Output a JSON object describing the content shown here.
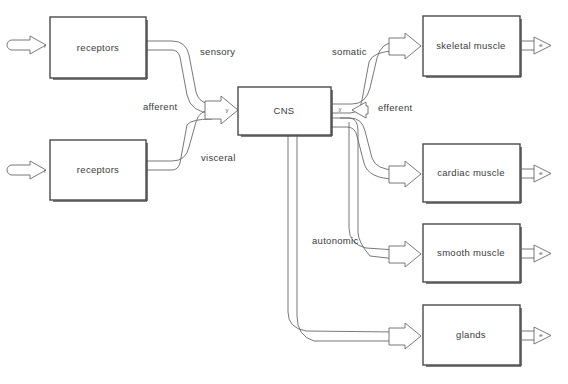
{
  "diagram": {
    "colors": {
      "background": "#ffffff",
      "stroke": "#4a4a4a",
      "pipe": "#6a6a6a",
      "text": "#3a3a3a"
    },
    "boxes": [
      {
        "id": "receptors-top",
        "label": "receptors",
        "x": 50,
        "y": 17,
        "w": 96,
        "h": 61
      },
      {
        "id": "receptors-bottom",
        "label": "receptors",
        "x": 50,
        "y": 140,
        "w": 96,
        "h": 60
      },
      {
        "id": "cns",
        "label": "CNS",
        "x": 238,
        "y": 87,
        "w": 93,
        "h": 48
      },
      {
        "id": "skeletal-muscle",
        "label": "skeletal muscle",
        "x": 423,
        "y": 16,
        "w": 97,
        "h": 60
      },
      {
        "id": "cardiac-muscle",
        "label": "cardiac muscle",
        "x": 423,
        "y": 144,
        "w": 97,
        "h": 58
      },
      {
        "id": "smooth-muscle",
        "label": "smooth muscle",
        "x": 423,
        "y": 224,
        "w": 97,
        "h": 58
      },
      {
        "id": "glands",
        "label": "glands",
        "x": 423,
        "y": 305,
        "w": 97,
        "h": 60
      }
    ],
    "edge_labels": [
      {
        "id": "sensory",
        "text": "sensory",
        "x": 200,
        "y": 52
      },
      {
        "id": "afferent",
        "text": "afferent",
        "x": 143,
        "y": 107
      },
      {
        "id": "visceral",
        "text": "visceral",
        "x": 201,
        "y": 158
      },
      {
        "id": "somatic",
        "text": "somatic",
        "x": 332,
        "y": 52
      },
      {
        "id": "efferent",
        "text": "efferent",
        "x": 378,
        "y": 108
      },
      {
        "id": "autonomic",
        "text": "autonomic",
        "x": 312,
        "y": 241
      }
    ],
    "junction_marks": [
      {
        "id": "cns-input-mark",
        "text": "y",
        "x": 227,
        "y": 108
      },
      {
        "id": "cns-output-mark",
        "text": "y",
        "x": 340,
        "y": 108
      },
      {
        "id": "receptor-top-input-mark",
        "text": "r",
        "x": 45,
        "y": 46
      },
      {
        "id": "receptor-bottom-input-mark",
        "text": "r",
        "x": 45,
        "y": 170
      }
    ],
    "output_dots": [
      {
        "id": "skeletal-output-dot",
        "text": "e",
        "x": 545,
        "y": 45
      },
      {
        "id": "cardiac-output-dot",
        "text": "e",
        "x": 545,
        "y": 173
      },
      {
        "id": "smooth-output-dot",
        "text": "e",
        "x": 545,
        "y": 253
      },
      {
        "id": "glands-output-dot",
        "text": "e",
        "x": 545,
        "y": 335
      }
    ],
    "input_arrows": [
      {
        "id": "input-arrow-receptors-top",
        "x": 10,
        "y": 45,
        "to": 50
      },
      {
        "id": "input-arrow-receptors-bottom",
        "x": 10,
        "y": 170,
        "to": 50
      }
    ],
    "output_arrows": [
      {
        "id": "output-arrow-skeletal",
        "y": 45,
        "from": 520,
        "to": 560
      },
      {
        "id": "output-arrow-cardiac",
        "y": 173,
        "from": 520,
        "to": 560
      },
      {
        "id": "output-arrow-smooth",
        "y": 253,
        "from": 520,
        "to": 560
      },
      {
        "id": "output-arrow-glands",
        "y": 335,
        "from": 520,
        "to": 560
      }
    ],
    "flows": [
      {
        "id": "flow-receptors-top-to-cns",
        "from": "receptors-top",
        "to": "cns",
        "label": "sensory"
      },
      {
        "id": "flow-receptors-bottom-to-cns",
        "from": "receptors-bottom",
        "to": "cns",
        "label": "visceral"
      },
      {
        "id": "flow-cns-to-skeletal",
        "from": "cns",
        "to": "skeletal-muscle",
        "label": "somatic"
      },
      {
        "id": "flow-cns-to-cardiac",
        "from": "cns",
        "to": "cardiac-muscle",
        "label": "autonomic"
      },
      {
        "id": "flow-cns-to-smooth",
        "from": "cns",
        "to": "smooth-muscle",
        "label": "autonomic"
      },
      {
        "id": "flow-cns-to-glands",
        "from": "cns",
        "to": "glands",
        "label": "autonomic"
      }
    ]
  }
}
